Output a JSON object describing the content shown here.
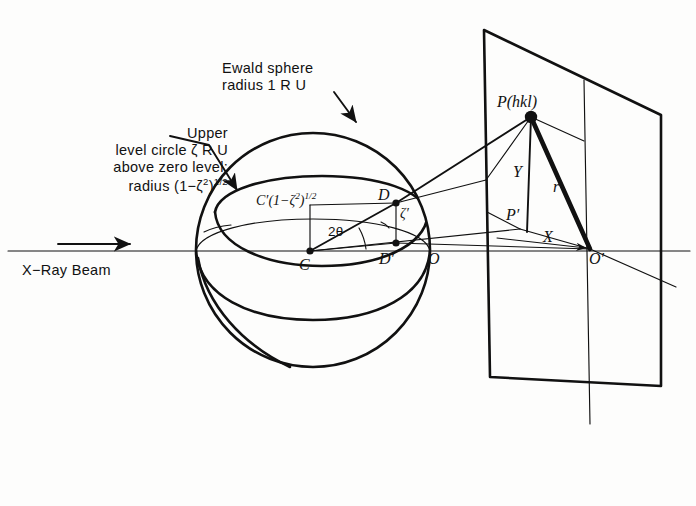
{
  "figure": {
    "background_color": "#fdfdfc",
    "ink_color": "#111111"
  },
  "labels": {
    "ewald_sphere_line1": "Ewald sphere",
    "ewald_sphere_line2": "radius 1 R U",
    "upper_level_line1": "Upper",
    "upper_level_line2": "level circle ζ R U",
    "upper_level_line3": "above zero level;",
    "upper_level_line4_prefix": "radius (1−ζ",
    "upper_level_line4_exp1": "2",
    "upper_level_line4_mid": ")",
    "upper_level_line4_exp2": "1/2",
    "xray_beam": "X−Ray Beam",
    "c_prime_prefix": "C′(1−ζ",
    "c_prime_exp1": "2",
    "c_prime_mid": ")",
    "c_prime_exp2": "1/2",
    "center_C": "C",
    "two_theta": "2θ",
    "point_D": "D",
    "point_D_prime": "D′",
    "zeta_prime": "ζ′",
    "point_O": "O",
    "reflection_P": "P(hkl)",
    "axis_Y": "Y",
    "radius_r": "r",
    "point_P_prime": "P′",
    "axis_X": "X",
    "point_O_prime": "O′"
  },
  "geometry": {
    "sphere": {
      "cx": 313,
      "cy": 250,
      "r": 117
    },
    "center_C": {
      "x": 310,
      "y": 251
    },
    "point_D": {
      "x": 396,
      "y": 203
    },
    "point_D_prime": {
      "x": 396,
      "y": 243
    },
    "point_O": {
      "x": 427,
      "y": 251
    },
    "point_P": {
      "x": 531,
      "y": 117
    },
    "point_P_prime": {
      "x": 520,
      "y": 229
    },
    "point_O_prime": {
      "x": 590,
      "y": 249
    },
    "plane_corners": [
      {
        "x": 484,
        "y": 30
      },
      {
        "x": 661,
        "y": 115
      },
      {
        "x": 661,
        "y": 386
      },
      {
        "x": 490,
        "y": 377
      }
    ],
    "beam_axis_y": 251,
    "two_theta_degrees": 29
  },
  "icons": {
    "leader_arrow": "arrow-icon",
    "beam_arrow": "arrow-icon"
  }
}
